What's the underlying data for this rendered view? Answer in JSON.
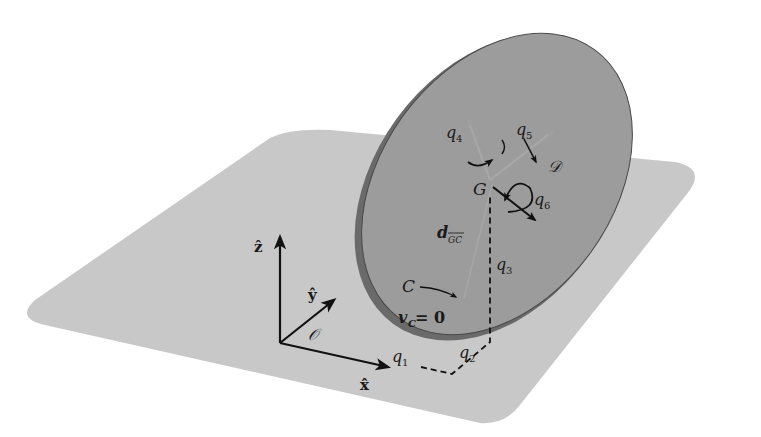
{
  "diagram": {
    "colors": {
      "background": "#ffffff",
      "plane": "#c8c8c8",
      "disk_face": "#9a9a9a",
      "disk_rim": "#5a5a5a",
      "ink": "#111111",
      "light_axis": "#b0b0b0"
    },
    "frame": {
      "origin_label": "𝒪",
      "x_label": "x̂",
      "y_label": "ŷ",
      "z_label": "ẑ"
    },
    "points": {
      "G": "G",
      "C": "C",
      "D": "𝒟"
    },
    "coordinates": {
      "q1": "q",
      "q1_sub": "1",
      "q2": "q",
      "q2_sub": "2",
      "q3": "q",
      "q3_sub": "3",
      "q4": "q",
      "q4_sub": "4",
      "q5": "q",
      "q5_sub": "5",
      "q6": "q",
      "q6_sub": "6"
    },
    "vectors": {
      "d_main": "d",
      "d_sub": "GC",
      "vc_main": "v",
      "vc_sub": "C",
      "vc_eq": " = 0"
    }
  }
}
